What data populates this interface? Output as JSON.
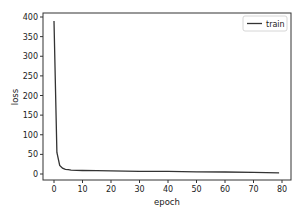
{
  "chart_data": {
    "type": "line",
    "title": "",
    "xlabel": "epoch",
    "ylabel": "loss",
    "xlim": [
      -4,
      83
    ],
    "ylim": [
      -20,
      410
    ],
    "xticks": [
      0,
      10,
      20,
      30,
      40,
      50,
      60,
      70,
      80
    ],
    "yticks": [
      0,
      50,
      100,
      150,
      200,
      250,
      300,
      350,
      400
    ],
    "grid": false,
    "legend_position": "upper right",
    "series": [
      {
        "name": "train",
        "color": "#333333",
        "x": [
          0,
          1,
          2,
          3,
          4,
          5,
          6,
          8,
          10,
          15,
          20,
          30,
          40,
          50,
          60,
          70,
          79
        ],
        "y": [
          390,
          55,
          22,
          15,
          12,
          11,
          10,
          9.5,
          9,
          8.5,
          8,
          7,
          6.5,
          5.5,
          5,
          4,
          3
        ]
      }
    ]
  }
}
